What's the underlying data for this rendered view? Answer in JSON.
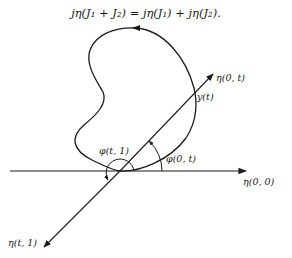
{
  "equation": {
    "text": "jη(J₁ + J₂) = jη(J₁) + jη(J₂)."
  },
  "diagram": {
    "stroke_color": "#1a1a1a",
    "background": "#ffffff",
    "labels": {
      "ray_0_t": "η(0, t)",
      "point_y_t": "y(t)",
      "ray_0_0": "η(0, 0)",
      "ray_t_1": "η(t, 1)",
      "angle_t_1": "φ(t, 1)",
      "angle_0_t": "φ(0, t)"
    },
    "origin": [
      120,
      171
    ],
    "rays": [
      {
        "name": "ray-0-0",
        "from": [
          10,
          171
        ],
        "to": [
          246,
          171
        ]
      },
      {
        "name": "ray-0-t",
        "from": [
          120,
          171
        ],
        "to": [
          213,
          74
        ]
      },
      {
        "name": "ray-t-1",
        "from": [
          120,
          171
        ],
        "to": [
          44,
          247
        ]
      }
    ]
  }
}
